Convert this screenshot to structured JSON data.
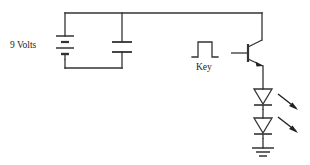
{
  "diagram": {
    "type": "electrical-schematic",
    "background_color": "#ffffff",
    "line_color": "#333333",
    "text_color": "#1b1b1b",
    "labels": {
      "battery": "9 Volts",
      "key": "Key"
    },
    "components": [
      {
        "name": "battery",
        "type": "battery",
        "label": "9 Volts",
        "cells": 2,
        "orientation": "vertical"
      },
      {
        "name": "capacitor",
        "type": "capacitor",
        "plates": 2,
        "orientation": "vertical"
      },
      {
        "name": "key-pulse",
        "type": "pulse-waveform",
        "label": "Key"
      },
      {
        "name": "transistor",
        "type": "npn-transistor",
        "terminals": [
          "collector",
          "base",
          "emitter"
        ]
      },
      {
        "name": "led-1",
        "type": "led",
        "emission_arrows": 1
      },
      {
        "name": "led-2",
        "type": "led",
        "emission_arrows": 1
      },
      {
        "name": "ground",
        "type": "ground",
        "bars": 3
      }
    ]
  }
}
